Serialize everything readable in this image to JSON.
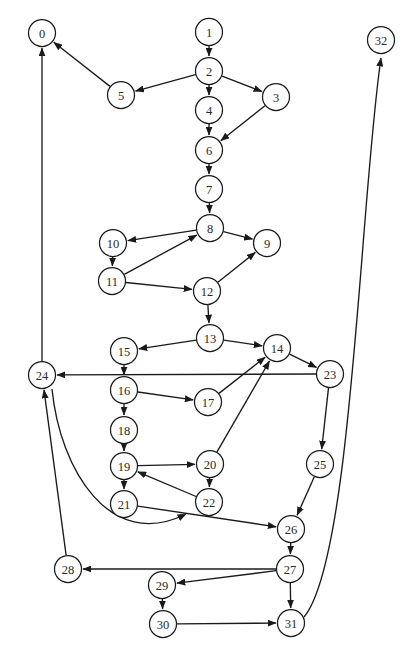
{
  "diagram": {
    "type": "directed-graph",
    "width": 415,
    "height": 654,
    "background_color": "#ffffff",
    "node_stroke_color": "#1a1a1a",
    "node_fill_color": "#ffffff",
    "edge_color": "#1a1a1a",
    "node_radius": 13.5,
    "nodes": [
      {
        "id": "0",
        "label": "0",
        "x": 42,
        "y": 33
      },
      {
        "id": "1",
        "label": "1",
        "x": 209,
        "y": 32
      },
      {
        "id": "2",
        "label": "2",
        "x": 209,
        "y": 71
      },
      {
        "id": "3",
        "label": "3",
        "x": 276,
        "y": 97
      },
      {
        "id": "4",
        "label": "4",
        "x": 209,
        "y": 110
      },
      {
        "id": "5",
        "label": "5",
        "x": 121,
        "y": 95
      },
      {
        "id": "6",
        "label": "6",
        "x": 209,
        "y": 150
      },
      {
        "id": "7",
        "label": "7",
        "x": 209,
        "y": 189
      },
      {
        "id": "8",
        "label": "8",
        "x": 210,
        "y": 228
      },
      {
        "id": "9",
        "label": "9",
        "x": 267,
        "y": 243
      },
      {
        "id": "10",
        "label": "10",
        "x": 113,
        "y": 243
      },
      {
        "id": "11",
        "label": "11",
        "x": 112,
        "y": 281
      },
      {
        "id": "12",
        "label": "12",
        "x": 207,
        "y": 291
      },
      {
        "id": "13",
        "label": "13",
        "x": 210,
        "y": 338
      },
      {
        "id": "14",
        "label": "14",
        "x": 277,
        "y": 348
      },
      {
        "id": "15",
        "label": "15",
        "x": 124,
        "y": 351
      },
      {
        "id": "16",
        "label": "16",
        "x": 124,
        "y": 390
      },
      {
        "id": "17",
        "label": "17",
        "x": 208,
        "y": 402
      },
      {
        "id": "18",
        "label": "18",
        "x": 124,
        "y": 430
      },
      {
        "id": "19",
        "label": "19",
        "x": 124,
        "y": 466
      },
      {
        "id": "20",
        "label": "20",
        "x": 210,
        "y": 464
      },
      {
        "id": "21",
        "label": "21",
        "x": 124,
        "y": 504
      },
      {
        "id": "22",
        "label": "22",
        "x": 209,
        "y": 502
      },
      {
        "id": "23",
        "label": "23",
        "x": 330,
        "y": 374
      },
      {
        "id": "24",
        "label": "24",
        "x": 42,
        "y": 375
      },
      {
        "id": "25",
        "label": "25",
        "x": 320,
        "y": 464
      },
      {
        "id": "26",
        "label": "26",
        "x": 291,
        "y": 529
      },
      {
        "id": "27",
        "label": "27",
        "x": 290,
        "y": 569
      },
      {
        "id": "28",
        "label": "28",
        "x": 68,
        "y": 569
      },
      {
        "id": "29",
        "label": "29",
        "x": 162,
        "y": 585
      },
      {
        "id": "30",
        "label": "30",
        "x": 163,
        "y": 624
      },
      {
        "id": "31",
        "label": "31",
        "x": 291,
        "y": 623
      },
      {
        "id": "32",
        "label": "32",
        "x": 381,
        "y": 40
      }
    ],
    "edges": [
      {
        "from": "1",
        "to": "2"
      },
      {
        "from": "2",
        "to": "5"
      },
      {
        "from": "2",
        "to": "3"
      },
      {
        "from": "2",
        "to": "4"
      },
      {
        "from": "5",
        "to": "0"
      },
      {
        "from": "3",
        "to": "6"
      },
      {
        "from": "4",
        "to": "6"
      },
      {
        "from": "6",
        "to": "7"
      },
      {
        "from": "7",
        "to": "8"
      },
      {
        "from": "8",
        "to": "10"
      },
      {
        "from": "8",
        "to": "9"
      },
      {
        "from": "10",
        "to": "11"
      },
      {
        "from": "11",
        "to": "8"
      },
      {
        "from": "11",
        "to": "12"
      },
      {
        "from": "12",
        "to": "9"
      },
      {
        "from": "12",
        "to": "13"
      },
      {
        "from": "13",
        "to": "15"
      },
      {
        "from": "13",
        "to": "14"
      },
      {
        "from": "14",
        "to": "23"
      },
      {
        "from": "15",
        "to": "16"
      },
      {
        "from": "16",
        "to": "17"
      },
      {
        "from": "16",
        "to": "18"
      },
      {
        "from": "17",
        "to": "14"
      },
      {
        "from": "18",
        "to": "19"
      },
      {
        "from": "19",
        "to": "20"
      },
      {
        "from": "19",
        "to": "21"
      },
      {
        "from": "20",
        "to": "14"
      },
      {
        "from": "20",
        "to": "22"
      },
      {
        "from": "22",
        "to": "19"
      },
      {
        "from": "21",
        "to": "26"
      },
      {
        "from": "23",
        "to": "24"
      },
      {
        "from": "23",
        "to": "25"
      },
      {
        "from": "24",
        "to": "0"
      },
      {
        "from": "24",
        "to": "22",
        "shape": "curve"
      },
      {
        "from": "25",
        "to": "26"
      },
      {
        "from": "26",
        "to": "27"
      },
      {
        "from": "27",
        "to": "28"
      },
      {
        "from": "27",
        "to": "29"
      },
      {
        "from": "27",
        "to": "31"
      },
      {
        "from": "28",
        "to": "24"
      },
      {
        "from": "29",
        "to": "30"
      },
      {
        "from": "30",
        "to": "31"
      },
      {
        "from": "31",
        "to": "32",
        "shape": "curve"
      }
    ]
  }
}
